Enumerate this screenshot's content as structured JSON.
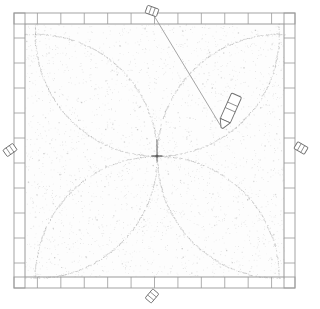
{
  "scene": {
    "title": "Quilting frame with compass-drawn circle pattern",
    "background_color": "#ffffff",
    "ink_color": "#8a8a8a",
    "frame_color": "#9a9a9a",
    "fabric_color": "#fdfdfd",
    "speckle_color": "#b9b9b9",
    "width": 316,
    "height": 309
  },
  "frame": {
    "name": "square-quilting-frame",
    "left": 14,
    "top": 13,
    "right": 295,
    "bottom": 288,
    "bar_width": 11,
    "tick_count_top": 12,
    "tick_count_bottom": 12,
    "tick_count_left": 11,
    "tick_count_right": 11
  },
  "fabric": {
    "name": "stretched-fabric-panel",
    "left": 25,
    "top": 24,
    "right": 284,
    "bottom": 277
  },
  "pattern": {
    "name": "four-petal-circle-pattern",
    "center": {
      "x": 157,
      "y": 156
    },
    "radius": 122,
    "circle_centers": [
      {
        "x": 157,
        "y": 34
      },
      {
        "x": 157,
        "y": 278
      },
      {
        "x": 35,
        "y": 156
      },
      {
        "x": 279,
        "y": 156
      }
    ],
    "stroke_color": "#a8a8a8",
    "stroke_width": 0.9
  },
  "center_mark": {
    "name": "center-pivot-cross",
    "x": 157,
    "y": 156,
    "size": 11
  },
  "pen": {
    "name": "marker-pen",
    "body_color": "#ffffff",
    "outline_color": "#6f6f6f",
    "tip": {
      "x": 222,
      "y": 128
    },
    "cap_top": {
      "x": 236,
      "y": 96
    },
    "length": 36,
    "width": 11,
    "angle_deg": 24
  },
  "string": {
    "name": "compass-string",
    "from": {
      "x": 153,
      "y": 14
    },
    "to": {
      "x": 222,
      "y": 128
    },
    "color": "#8e8e8e"
  },
  "clips": [
    {
      "name": "binder-clip-top",
      "x": 152,
      "y": 11,
      "angle": 110
    },
    {
      "name": "binder-clip-left",
      "x": 10,
      "y": 150,
      "angle": 55
    },
    {
      "name": "binder-clip-right",
      "x": 301,
      "y": 148,
      "angle": 120
    },
    {
      "name": "binder-clip-bottom",
      "x": 152,
      "y": 296,
      "angle": 40
    }
  ],
  "speckles": {
    "name": "fabric-texture-speckles",
    "count": 2600,
    "seed": 20240517
  }
}
